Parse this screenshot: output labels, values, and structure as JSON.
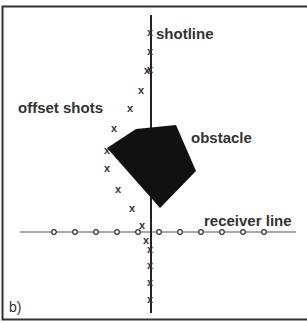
{
  "figure": {
    "panel_label": "b)",
    "labels": {
      "shotline": "shotline",
      "offset_shots": "offset shots",
      "obstacle": "obstacle",
      "receiver_line": "receiver line"
    },
    "colors": {
      "frame": "#333333",
      "line": "#222222",
      "obstacle": "#111111",
      "text": "#333333"
    },
    "shotline_x": 150,
    "receiver_line_y": 232,
    "shots_on_line": [
      [
        150,
        32
      ],
      [
        150,
        51
      ],
      [
        150,
        69
      ],
      [
        150,
        249
      ],
      [
        150,
        265
      ],
      [
        150,
        282
      ],
      [
        150,
        299
      ]
    ],
    "offset_shots": [
      [
        147,
        70
      ],
      [
        141,
        90
      ],
      [
        130,
        108
      ],
      [
        114,
        128
      ],
      [
        107,
        150
      ],
      [
        107,
        168
      ],
      [
        118,
        189
      ],
      [
        132,
        208
      ],
      [
        142,
        225
      ],
      [
        146,
        240
      ]
    ],
    "receivers_x": [
      54,
      75,
      96,
      117,
      138,
      159,
      180,
      201,
      222,
      243,
      264
    ],
    "obstacle_polygon": [
      [
        107,
        148
      ],
      [
        136,
        129
      ],
      [
        176,
        125
      ],
      [
        196,
        171
      ],
      [
        160,
        208
      ]
    ]
  }
}
